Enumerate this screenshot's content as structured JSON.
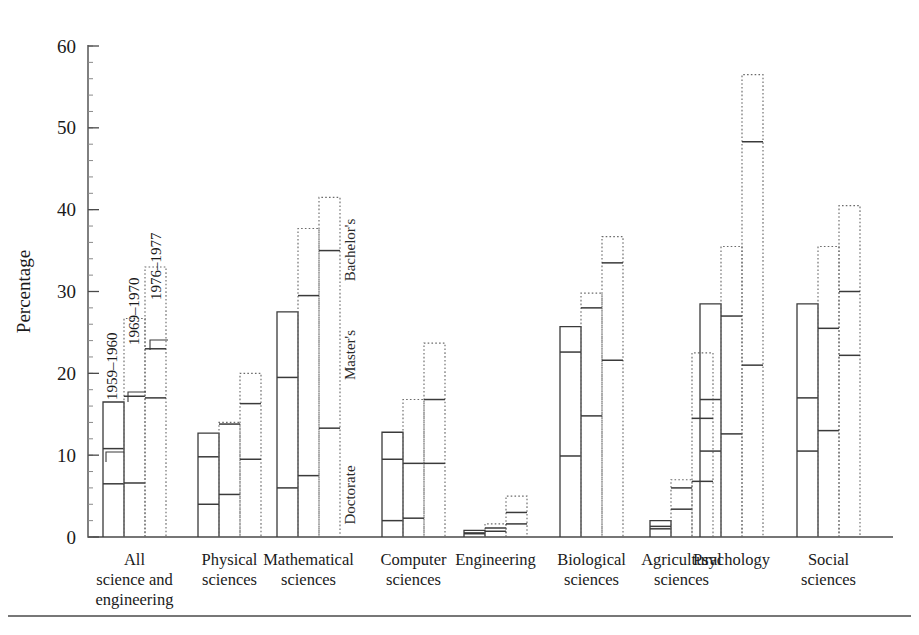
{
  "chart_data": {
    "type": "bar",
    "title": "",
    "subtitle": "",
    "xlabel": "",
    "ylabel": "Percentage",
    "ylim": [
      0,
      60
    ],
    "yticks": [
      0,
      10,
      20,
      30,
      40,
      50,
      60
    ],
    "ytick_labels": [
      "0",
      "10",
      "20",
      "30",
      "40",
      "50",
      "60"
    ],
    "minor_tick_step": 2,
    "grid": false,
    "legend_position": "in-plot-annotations",
    "orientation": "vertical",
    "grouping": "grouped",
    "bars_per_group": 3,
    "categories": [
      "All science and engineering",
      "Physical sciences",
      "Mathematical sciences",
      "Computer sciences",
      "Engineering",
      "Biological sciences",
      "Agricultural sciences",
      "Psychology",
      "Social sciences"
    ],
    "category_label_lines": [
      [
        "All",
        "science and",
        "engineering"
      ],
      [
        "Physical",
        "sciences"
      ],
      [
        "Mathematical",
        "sciences"
      ],
      [
        "Computer",
        "sciences"
      ],
      [
        "Engineering"
      ],
      [
        "Biological",
        "sciences"
      ],
      [
        "Agricultural",
        "sciences"
      ],
      [
        "Psychology"
      ],
      [
        "Social",
        "sciences"
      ]
    ],
    "series": [
      {
        "name": "1959-1960",
        "style": "solid",
        "values": [
          16.5,
          12.7,
          27.5,
          12.8,
          0.8,
          25.7,
          2.0,
          28.5,
          28.5
        ]
      },
      {
        "name": "1969-1970",
        "style": "dotted",
        "values": [
          26.7,
          14.0,
          37.7,
          16.8,
          1.6,
          29.8,
          7.0,
          35.5,
          35.5
        ]
      },
      {
        "name": "1976-1977",
        "style": "dotted",
        "values": [
          33.0,
          20.0,
          41.5,
          23.7,
          5.0,
          36.7,
          22.5,
          56.5,
          40.5
        ]
      }
    ],
    "degree_levels": [
      "Bachelor's",
      "Master's",
      "Doctorate"
    ],
    "level_marks": {
      "note": "Bar top = Bachelor's percentage; interior horizontal ticks mark Master's and Doctorate percentages.",
      "All science and engineering": {
        "1959-1960": {
          "masters": 10.8,
          "doctorate": 6.5
        },
        "1969-1970": {
          "masters": 17.2,
          "doctorate": 6.6
        },
        "1976-1977": {
          "masters": 23.0,
          "doctorate": 17.0
        }
      },
      "Physical sciences": {
        "1959-1960": {
          "masters": 9.8,
          "doctorate": 4.0
        },
        "1969-1970": {
          "masters": 13.8,
          "doctorate": 5.2
        },
        "1976-1977": {
          "masters": 16.3,
          "doctorate": 9.5
        }
      },
      "Mathematical sciences": {
        "1959-1960": {
          "masters": 19.5,
          "doctorate": 6.0
        },
        "1969-1970": {
          "masters": 29.5,
          "doctorate": 7.5
        },
        "1976-1977": {
          "masters": 35.0,
          "doctorate": 13.3
        }
      },
      "Computer sciences": {
        "1959-1960": {
          "masters": 9.5,
          "doctorate": 2.0
        },
        "1969-1970": {
          "masters": 9.0,
          "doctorate": 2.3
        },
        "1976-1977": {
          "masters": 16.8,
          "doctorate": 9.0
        }
      },
      "Engineering": {
        "1959-1960": {
          "masters": 0.5,
          "doctorate": 0.4
        },
        "1969-1970": {
          "masters": 1.1,
          "doctorate": 0.7
        },
        "1976-1977": {
          "masters": 3.0,
          "doctorate": 1.6
        }
      },
      "Biological sciences": {
        "1959-1960": {
          "masters": 22.6,
          "doctorate": 9.9
        },
        "1969-1970": {
          "masters": 28.0,
          "doctorate": 14.8
        },
        "1976-1977": {
          "masters": 33.5,
          "doctorate": 21.6
        }
      },
      "Agricultural sciences": {
        "1959-1960": {
          "masters": 1.3,
          "doctorate": 1.0
        },
        "1969-1970": {
          "masters": 6.0,
          "doctorate": 3.4
        },
        "1976-1977": {
          "masters": 14.5,
          "doctorate": 6.8
        }
      },
      "Psychology": {
        "1959-1960": {
          "masters": 16.8,
          "doctorate": 10.5
        },
        "1969-1970": {
          "masters": 27.0,
          "doctorate": 12.6
        },
        "1976-1977": {
          "masters": 48.3,
          "doctorate": 21.0
        }
      },
      "Social sciences": {
        "1959-1960": {
          "masters": 17.0,
          "doctorate": 10.5
        },
        "1969-1970": {
          "masters": 25.5,
          "doctorate": 13.0
        },
        "1976-1977": {
          "masters": 30.0,
          "doctorate": 22.2
        }
      }
    },
    "annotations": [
      {
        "text": "1959-1960",
        "rotation": -90
      },
      {
        "text": "1969-1970",
        "rotation": -90
      },
      {
        "text": "1976-1977",
        "rotation": -90
      },
      {
        "text": "Bachelor's",
        "rotation": -90
      },
      {
        "text": "Master's",
        "rotation": -90
      },
      {
        "text": "Doctorate",
        "rotation": -90
      }
    ]
  },
  "colors": {
    "background": "#ffffff",
    "axis": "#4a4a4a",
    "bar_solid": "#3a3a3a",
    "bar_dotted": "#6b6b6b",
    "text": "#1a1a1a"
  }
}
